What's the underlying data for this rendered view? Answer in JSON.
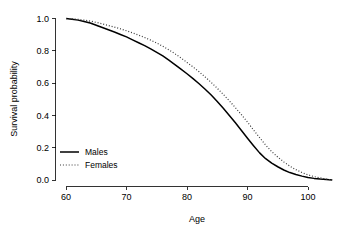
{
  "chart_data": {
    "type": "line",
    "title": "",
    "xlabel": "Age",
    "ylabel": "Survival probability",
    "xlim": [
      58,
      105
    ],
    "ylim": [
      0.0,
      1.0
    ],
    "grid": false,
    "legend_position": "bottom-left",
    "xticks": [
      60,
      70,
      80,
      90,
      100
    ],
    "xtick_labels": [
      "60",
      "70",
      "80",
      "90",
      "100"
    ],
    "yticks": [
      0.0,
      0.2,
      0.4,
      0.6,
      0.8,
      1.0
    ],
    "ytick_labels": [
      "0.0",
      "0.2",
      "0.4",
      "0.6",
      "0.8",
      "1.0"
    ],
    "x": [
      60,
      61,
      62,
      63,
      64,
      65,
      66,
      67,
      68,
      69,
      70,
      71,
      72,
      73,
      74,
      75,
      76,
      77,
      78,
      79,
      80,
      81,
      82,
      83,
      84,
      85,
      86,
      87,
      88,
      89,
      90,
      91,
      92,
      93,
      94,
      95,
      96,
      97,
      98,
      99,
      100,
      101,
      102,
      103,
      104
    ],
    "series": [
      {
        "name": "Males",
        "style": "solid",
        "color": "#000000",
        "values": [
          1.0,
          0.995,
          0.99,
          0.982,
          0.972,
          0.958,
          0.944,
          0.93,
          0.916,
          0.901,
          0.886,
          0.868,
          0.85,
          0.832,
          0.812,
          0.79,
          0.768,
          0.742,
          0.714,
          0.686,
          0.658,
          0.628,
          0.596,
          0.562,
          0.526,
          0.486,
          0.444,
          0.4,
          0.354,
          0.306,
          0.258,
          0.212,
          0.168,
          0.132,
          0.104,
          0.082,
          0.062,
          0.046,
          0.034,
          0.024,
          0.016,
          0.01,
          0.006,
          0.003,
          0.0
        ]
      },
      {
        "name": "Females",
        "style": "dotted",
        "color": "#3a3a3a",
        "values": [
          1.0,
          0.998,
          0.995,
          0.99,
          0.984,
          0.976,
          0.967,
          0.957,
          0.947,
          0.936,
          0.924,
          0.911,
          0.897,
          0.882,
          0.866,
          0.848,
          0.828,
          0.806,
          0.782,
          0.756,
          0.728,
          0.7,
          0.67,
          0.638,
          0.604,
          0.568,
          0.53,
          0.49,
          0.448,
          0.404,
          0.358,
          0.31,
          0.262,
          0.216,
          0.176,
          0.142,
          0.112,
          0.086,
          0.064,
          0.046,
          0.032,
          0.021,
          0.013,
          0.006,
          0.0
        ]
      }
    ]
  },
  "legend": {
    "items": [
      {
        "label": "Males"
      },
      {
        "label": "Females"
      }
    ]
  }
}
